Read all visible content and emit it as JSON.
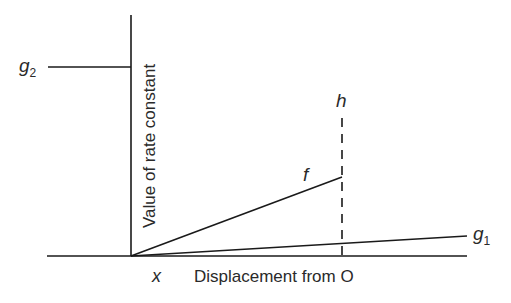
{
  "diagram": {
    "y_axis_label": "Value of rate constant",
    "x_axis_label": "Displacement from O",
    "origin_label": "x",
    "lines": {
      "g2": {
        "letter": "g",
        "subscript": "2"
      },
      "g1": {
        "letter": "g",
        "subscript": "1"
      },
      "f": {
        "letter": "f"
      },
      "h": {
        "letter": "h"
      }
    },
    "colors": {
      "line": "#1a1a1a",
      "text": "#2a2a2a"
    }
  }
}
